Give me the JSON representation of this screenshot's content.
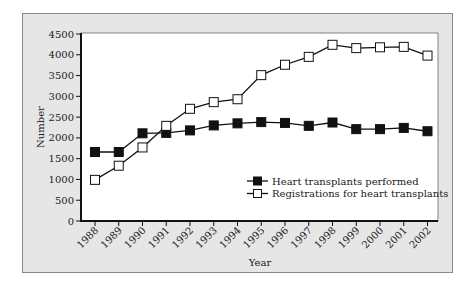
{
  "chart_data": {
    "type": "line",
    "title": "",
    "xlabel": "Year",
    "ylabel": "Number",
    "ylim": [
      0,
      4500
    ],
    "yticks": [
      0,
      500,
      1000,
      1500,
      2000,
      2500,
      3000,
      3500,
      4000,
      4500
    ],
    "categories": [
      "1988",
      "1989",
      "1990",
      "1991",
      "1992",
      "1993",
      "1994",
      "1995",
      "1996",
      "1997",
      "1998",
      "1999",
      "2000",
      "2001",
      "2002"
    ],
    "series": [
      {
        "name": "Heart transplants performed",
        "marker": "filled-square",
        "values": [
          1660,
          1660,
          2110,
          2120,
          2180,
          2300,
          2350,
          2380,
          2360,
          2290,
          2370,
          2210,
          2210,
          2240,
          2160
        ]
      },
      {
        "name": "Registrations for heart transplants",
        "marker": "open-square",
        "values": [
          990,
          1330,
          1770,
          2290,
          2700,
          2860,
          2930,
          3510,
          3760,
          3950,
          4240,
          4160,
          4180,
          4190,
          3980
        ]
      }
    ],
    "grid": false,
    "legend_position": "lower right"
  },
  "colors": {
    "frame_bg": "#e6e6e6",
    "plot_bg": "#ffffff",
    "line": "#111111"
  }
}
